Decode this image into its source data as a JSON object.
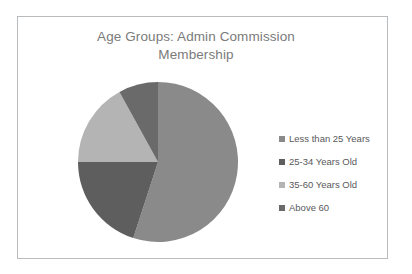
{
  "chart_data": {
    "type": "pie",
    "title": "Age Groups: Admin Commission Membership",
    "title_line1": "Age Groups: Admin Commission",
    "title_line2": "Membership",
    "categories": [
      "Less than 25 Years",
      "25-34 Years Old",
      "35-60 Years Old",
      "Above 60"
    ],
    "values": [
      55,
      20,
      17,
      8
    ],
    "unit": "percent",
    "colors": [
      "#8a8a8a",
      "#5e5e5e",
      "#b4b4b4",
      "#6a6a6a"
    ],
    "start_angle_deg": 0,
    "direction": "clockwise",
    "legend_position": "right",
    "grid": false,
    "xlabel": "",
    "ylabel": "",
    "slices": [
      {
        "label": "Less than 25 Years",
        "value": 55,
        "color": "#8a8a8a"
      },
      {
        "label": "25-34 Years Old",
        "value": 20,
        "color": "#5e5e5e"
      },
      {
        "label": "35-60 Years Old",
        "value": 17,
        "color": "#b4b4b4"
      },
      {
        "label": "Above 60",
        "value": 8,
        "color": "#6a6a6a"
      }
    ]
  },
  "legend": {
    "items": [
      {
        "label": "Less than 25 Years",
        "color": "#8a8a8a",
        "marker": "square-swatch-icon"
      },
      {
        "label": "25-34 Years Old",
        "color": "#5e5e5e",
        "marker": "square-swatch-icon"
      },
      {
        "label": "35-60 Years Old",
        "color": "#b4b4b4",
        "marker": "square-swatch-icon"
      },
      {
        "label": "Above 60",
        "color": "#6a6a6a",
        "marker": "square-swatch-icon"
      }
    ]
  },
  "card": {
    "border_color": "#b9bcbe",
    "background": "#ffffff",
    "title_color": "#7b7b7b"
  }
}
